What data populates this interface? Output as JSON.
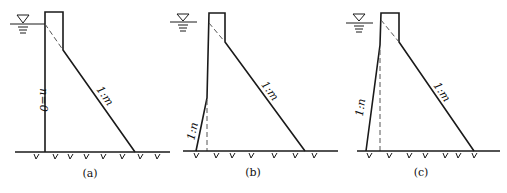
{
  "figure": {
    "panels": [
      {
        "id": "a",
        "caption": "(a)",
        "upstream_label": "n=0",
        "downstream_label": "1:m"
      },
      {
        "id": "b",
        "caption": "(b)",
        "upstream_label": "1:n",
        "downstream_label": "1:m"
      },
      {
        "id": "c",
        "caption": "(c)",
        "upstream_label": "1:n",
        "downstream_label": "1:m"
      }
    ],
    "water_level_symbol": "▽"
  }
}
